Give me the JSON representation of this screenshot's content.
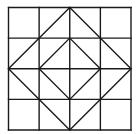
{
  "diagram": {
    "grid": {
      "rows": 4,
      "cols": 4
    },
    "frame": {
      "x": 8.5,
      "y": 7.5,
      "size": 122.5
    },
    "stroke_color": "#1a1a1a",
    "stroke_width": 1.4,
    "background": "#ffffff",
    "shapes": [
      {
        "name": "outer-diamond",
        "points": [
          [
            2,
            0
          ],
          [
            4,
            2
          ],
          [
            2,
            4
          ],
          [
            0,
            2
          ]
        ]
      },
      {
        "name": "inner-diamond",
        "points": [
          [
            2,
            1
          ],
          [
            3,
            2
          ],
          [
            2,
            3
          ],
          [
            1,
            2
          ]
        ]
      }
    ]
  }
}
